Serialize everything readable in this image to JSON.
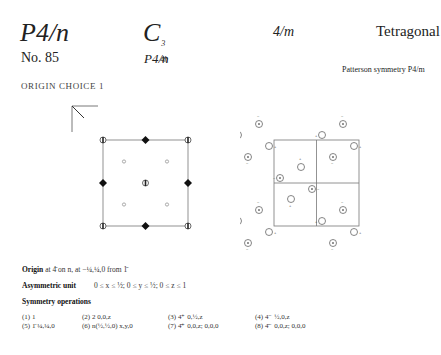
{
  "header": {
    "hermann_mauguin": "P4/n",
    "schoenflies_base": "C",
    "schoenflies_sub": "4h",
    "schoenflies_sup": "3",
    "point_group": "4/m",
    "crystal_system": "Tetragonal",
    "number": "No. 85",
    "short_symbol": "P4/n",
    "patterson": "Patterson symmetry P4/m"
  },
  "origin_choice": "ORIGIN CHOICE 1",
  "origin": {
    "label": "Origin",
    "text": "at 4̄ on n, at −¼,¼,0 from 1̄"
  },
  "asymmetric_unit": {
    "label": "Asymmetric unit",
    "text": "0 ≤ x ≤ ½;   0 ≤ y ≤ ½;   0 ≤ z ≤ 1"
  },
  "symmetry_operations": {
    "label": "Symmetry operations",
    "items": [
      "(1) 1",
      "(2) 2  0,0,z",
      "(3) 4⁺  0,½,z",
      "(4) 4⁻  ½,0,z",
      "(5) 1̄  ¼,¼,0",
      "(6) n(½,½,0)  x,y,0",
      "(7) 4̄⁺  0,0,z;  0,0,0",
      "(8) 4̄⁻  0,0,z;  0,0,0"
    ]
  },
  "diagrams": {
    "symmetry_diagram": "symmetry-element-diagram",
    "general_position_diagram": "general-position-diagram"
  }
}
